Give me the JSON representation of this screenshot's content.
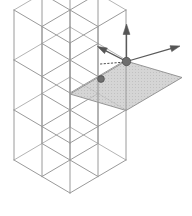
{
  "figure": {
    "type": "diagram",
    "background_color": "#ffffff",
    "canvas": {
      "width": 192,
      "height": 216
    }
  },
  "style": {
    "wireframe_color": "#9a9a9a",
    "wireframe_color_light": "#b4b4b4",
    "wireframe_width": 1.0,
    "plane_fill": "#c8c8c8",
    "plane_fill_opacity": 0.78,
    "plane_stroke": "#8c8c8c",
    "marker_color": "#6e6e6e",
    "marker_edge": "#4a4a4a",
    "arrow_color": "#5a5a5a",
    "arrow_head_color": "#555555",
    "dotted_color": "#4f4f4f"
  },
  "projection": {
    "origin_x": 14,
    "origin_y": 160,
    "axis_a": {
      "label": "a",
      "dx": 28.0,
      "dy": -16.5
    },
    "axis_b": {
      "label": "b",
      "dx": 28.0,
      "dy": 16.5
    },
    "axis_c": {
      "label": "c",
      "dx": 0.0,
      "dy": -50.0
    },
    "counts": {
      "na": 2,
      "nb": 2,
      "nc": 3
    },
    "note": "a runs up-right, b runs down-right, c runs vertically up"
  },
  "highlighted_plane": {
    "name": "basal-plane",
    "cell_indices": {
      "a": 2,
      "b": 1,
      "c": 2
    },
    "corners": [
      {
        "x": 70.0,
        "y": 94.0
      },
      {
        "x": 126.0,
        "y": 61.0
      },
      {
        "x": 182.0,
        "y": 77.5
      },
      {
        "x": 126.0,
        "y": 110.5
      }
    ]
  },
  "markers": [
    {
      "name": "origin-node",
      "x": 126.5,
      "y": 61.5,
      "radius": 4.2
    },
    {
      "name": "interior-node",
      "x": 101.0,
      "y": 79.0,
      "radius": 3.4
    }
  ],
  "dotted_line": {
    "name": "inter-node-connector",
    "x1": 100.5,
    "y1": 64.0,
    "x2": 126.0,
    "y2": 62.0,
    "dash": "1.4 2.2"
  },
  "arrows": [
    {
      "name": "vector-c-up",
      "label": "c",
      "x1": 126.5,
      "y1": 61.5,
      "x2": 126.5,
      "y2": 24.0,
      "head_size": 5.5,
      "direction": "up"
    },
    {
      "name": "vector-a-left",
      "label": "a",
      "x1": 126.5,
      "y1": 61.5,
      "x2": 97.5,
      "y2": 46.5,
      "head_size": 5.0,
      "direction": "up-left"
    },
    {
      "name": "vector-b-right",
      "label": "b",
      "x1": 126.5,
      "y1": 61.5,
      "x2": 180.0,
      "y2": 46.0,
      "head_size": 5.0,
      "direction": "up-right"
    }
  ],
  "legend": {
    "visible": false,
    "entries": []
  },
  "labels": {
    "visible": false,
    "items": []
  }
}
